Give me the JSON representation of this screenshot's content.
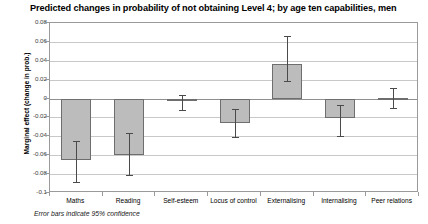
{
  "chart_data": {
    "type": "bar",
    "title": "Predicted changes in probability of not obtaining Level 4; by age ten capabilities, men",
    "xlabel": "",
    "ylabel": "Marginal effect (change in prob.)",
    "ylim": [
      -0.1,
      0.08
    ],
    "ytick_labels": [
      "0.08",
      "0.06",
      "0.04",
      "0.02",
      "0",
      "-0.02",
      "-0.04",
      "-0.06",
      "-0.08",
      "-0.1"
    ],
    "ytick_values": [
      0.08,
      0.06,
      0.04,
      0.02,
      0,
      -0.02,
      -0.04,
      -0.06,
      -0.08,
      -0.1
    ],
    "grid": true,
    "legend": "none",
    "categories": [
      "Maths",
      "Reading",
      "Self-esteem",
      "Locus of control",
      "Externalising",
      "Internalising",
      "Peer relations"
    ],
    "values": [
      -0.065,
      -0.06,
      -0.003,
      -0.026,
      0.037,
      -0.021,
      0.001
    ],
    "error_low": [
      -0.088,
      -0.081,
      -0.012,
      -0.041,
      0.019,
      -0.04,
      -0.01
    ],
    "error_high": [
      -0.045,
      -0.036,
      0.004,
      -0.011,
      0.066,
      -0.007,
      0.011
    ],
    "error_note": "Error bars indicate 95% confidence",
    "bar_fill": "#bcbcbc",
    "bar_stroke": "#6e6e6e",
    "error_color": "#4a4a4a",
    "grid_color": "#c8c8c8",
    "frame_color": "#9a9a9a",
    "background": "#ffffff"
  }
}
